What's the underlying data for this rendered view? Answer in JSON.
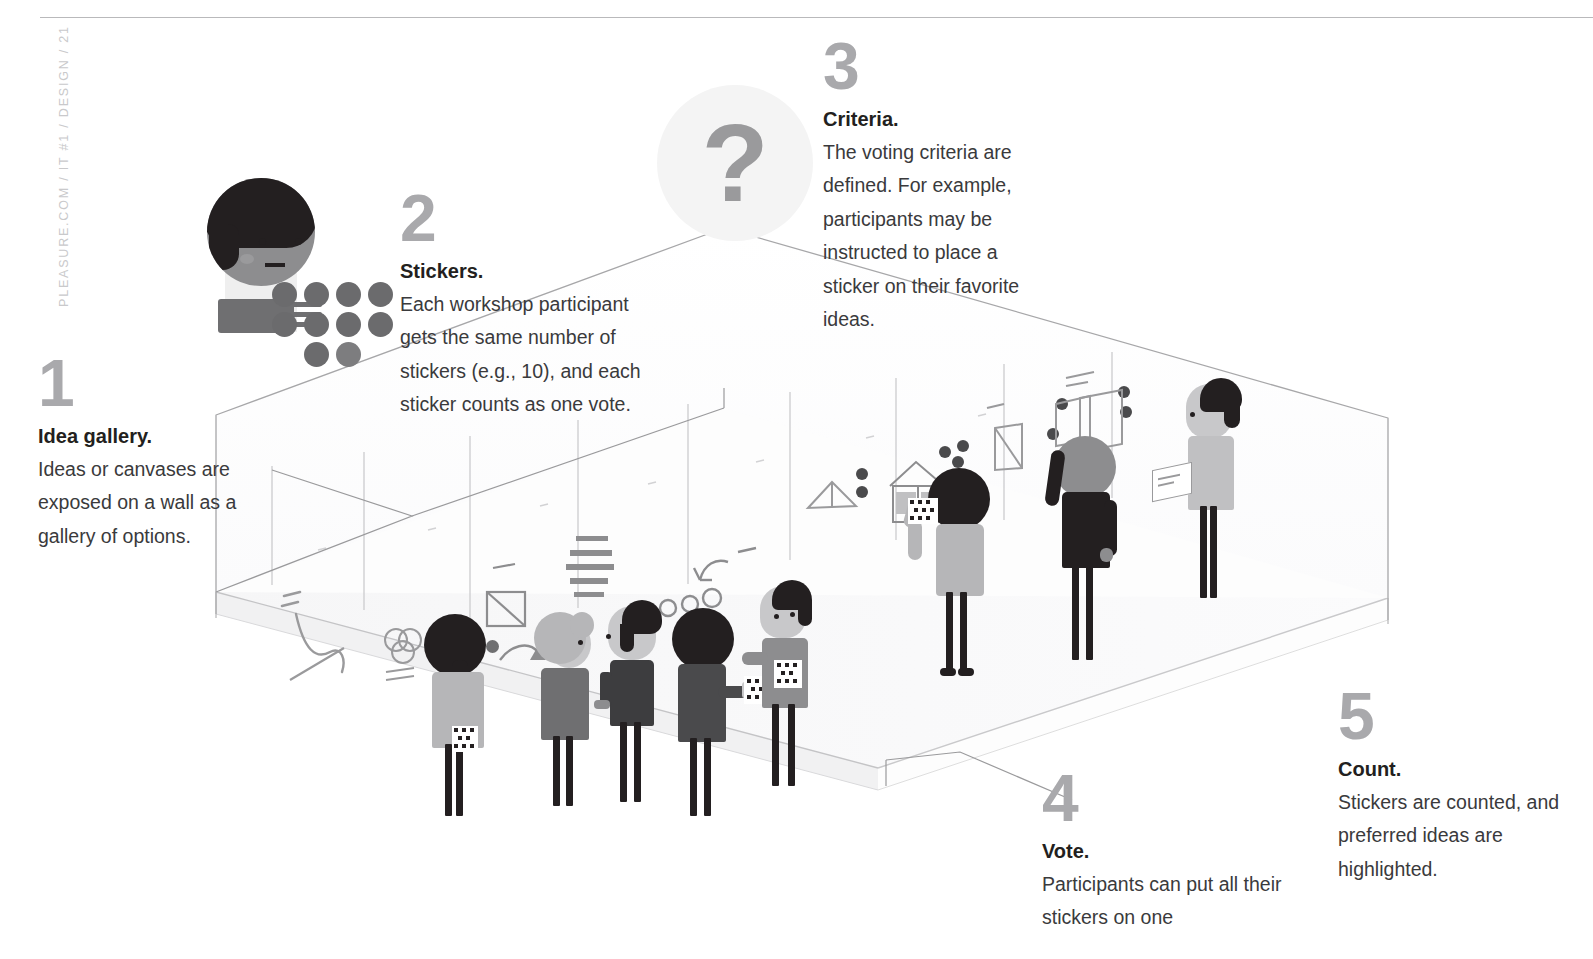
{
  "page": {
    "running_head": "PLEASURE.COM / IT #1 / DESIGN / 21",
    "background_color": "#ffffff"
  },
  "colors": {
    "step_number": "#a9a9ac",
    "title_text": "#231f20",
    "body_text": "#3a3a3c",
    "rule": "#b9b9bb",
    "leader_line": "#9a9a9c",
    "dark_figure": "#231f20",
    "mid_gray": "#8d8d8f",
    "light_gray": "#c8c8ca",
    "floor": "#f7f7f8",
    "bubble": "#f4f4f4"
  },
  "steps": [
    {
      "number": "1",
      "title": "Idea gallery.",
      "body": "Ideas or canvases are exposed on a wall as a gallery of options."
    },
    {
      "number": "2",
      "title": "Stickers.",
      "body": "Each workshop participant gets the same number of stickers (e.g., 10), and each sticker counts as one vote."
    },
    {
      "number": "3",
      "title": "Criteria.",
      "body": "The voting criteria are defined. For example, participants may be instructed to place a sticker on their favorite ideas."
    },
    {
      "number": "4",
      "title": "Vote.",
      "body": "Participants can put all their stickers on one"
    },
    {
      "number": "5",
      "title": "Count.",
      "body": "Stickers are counted, and preferred ideas are highlighted."
    }
  ],
  "illustration": {
    "question_mark": "?",
    "icons": [
      "question-mark-icon",
      "sticker-sheet-icon",
      "gallery-wall",
      "idea-canvas",
      "voting-dot"
    ],
    "sticker_sheet_rows": 3,
    "sticker_sheet_cols": 4,
    "figure_count": 8
  }
}
